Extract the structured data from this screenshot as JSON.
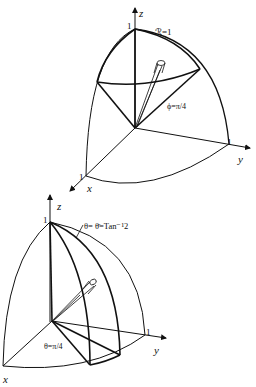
{
  "figures": [
    {
      "id": "top",
      "description": "Octant of unit sphere with cone phi = pi/4 and a thin tube element",
      "axes": {
        "x": "x",
        "y": "y",
        "z": "z"
      },
      "ticks": {
        "x": "1",
        "y": "1",
        "z": "1"
      },
      "labels": {
        "radius": "ℛ=1",
        "cone": "ϕ=π/4"
      }
    },
    {
      "id": "bottom",
      "description": "Octant of unit sphere with half-planes theta = pi/4 and theta = theta-bar = Tan^-1 2",
      "axes": {
        "x": "x",
        "y": "y",
        "z": "z"
      },
      "ticks": {
        "y": "1",
        "z": "1"
      },
      "labels": {
        "plane_a": "θ=π/4",
        "plane_b": "θ= θ̄=Tan⁻¹2"
      }
    }
  ],
  "colors": {
    "ink": "#111111",
    "background": "#ffffff"
  }
}
